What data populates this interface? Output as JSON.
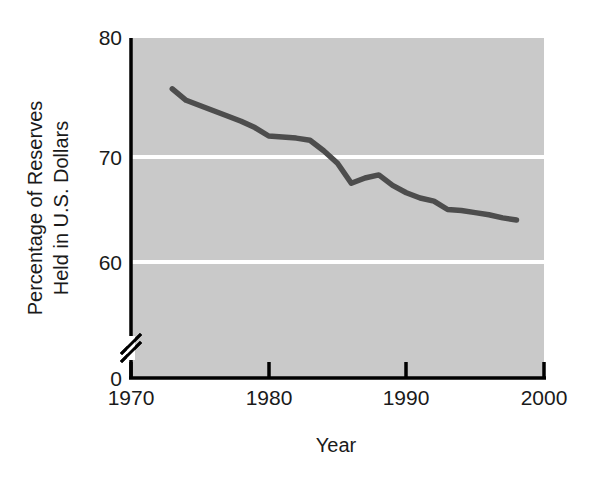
{
  "chart_data": {
    "type": "line",
    "title": "",
    "subtitle": "",
    "xlabel": "Year",
    "ylabel": "Percentage of Reserves Held in U.S. Dollars",
    "ylabel_line1": "Percentage of Reserves",
    "ylabel_line2": "Held in U.S. Dollars",
    "xlim": [
      1970,
      2000
    ],
    "ylim": [
      60,
      80
    ],
    "y_axis_break": true,
    "y_axis_origin_label": "0",
    "grid": "horizontal-white-gridlines",
    "legend": "none",
    "plot_background_color": "#c9c9c9",
    "gridline_color": "#ffffff",
    "line_color": "#4d4d4d",
    "axis_color": "#000000",
    "xticks": [
      1970,
      1980,
      1990,
      2000
    ],
    "xtick_labels": [
      "1970",
      "1980",
      "1990",
      "2000"
    ],
    "yticks": [
      0,
      60,
      70,
      80
    ],
    "ytick_labels": [
      "0",
      "60",
      "70",
      "80"
    ],
    "series": [
      {
        "name": "Percentage of reserves held in U.S. dollars",
        "x": [
          1973,
          1974,
          1975,
          1976,
          1977,
          1978,
          1979,
          1980,
          1981,
          1982,
          1983,
          1984,
          1985,
          1986,
          1987,
          1988,
          1989,
          1990,
          1991,
          1992,
          1993,
          1994,
          1995,
          1996,
          1997,
          1998
        ],
        "values": [
          76.5,
          75.4,
          74.9,
          74.4,
          73.9,
          73.4,
          72.8,
          72.0,
          71.9,
          71.8,
          71.6,
          70.6,
          69.4,
          67.5,
          68.0,
          68.3,
          67.3,
          66.6,
          66.1,
          65.8,
          65.0,
          64.9,
          64.7,
          64.5,
          64.2,
          64.0
        ]
      }
    ]
  },
  "axis": {
    "x_label": "Year",
    "y_label_line1": "Percentage of Reserves",
    "y_label_line2": "Held in U.S. Dollars",
    "x_tick_1": "1970",
    "x_tick_2": "1980",
    "x_tick_3": "1990",
    "x_tick_4": "2000",
    "y_tick_0": "0",
    "y_tick_60": "60",
    "y_tick_70": "70",
    "y_tick_80": "80"
  }
}
